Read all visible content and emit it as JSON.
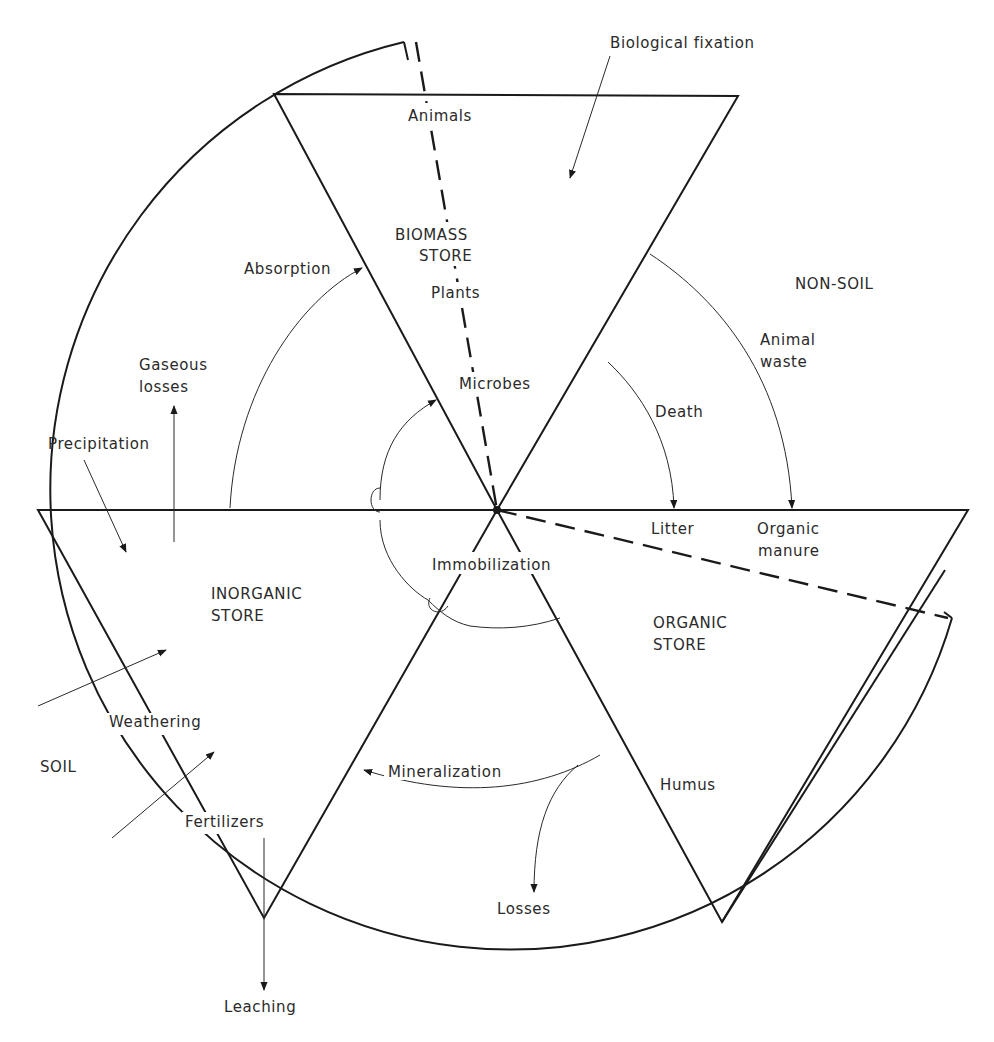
{
  "diagram": {
    "regions": {
      "non_soil": "NON-SOIL",
      "soil": "SOIL"
    },
    "stores": {
      "biomass": {
        "line1": "BIOMASS",
        "line2": "STORE",
        "components": [
          "Animals",
          "Plants",
          "Microbes"
        ]
      },
      "inorganic": {
        "line1": "INORGANIC",
        "line2": "STORE"
      },
      "organic": {
        "line1": "ORGANIC",
        "line2": "STORE",
        "components": [
          "Litter",
          "Organic",
          "manure",
          "Humus"
        ]
      }
    },
    "flows": {
      "biological_fixation": "Biological fixation",
      "absorption": "Absorption",
      "gaseous_losses_1": "Gaseous",
      "gaseous_losses_2": "losses",
      "precipitation": "Precipitation",
      "death": "Death",
      "animal_waste_1": "Animal",
      "animal_waste_2": "waste",
      "immobilization": "Immobilization",
      "mineralization": "Mineralization",
      "weathering": "Weathering",
      "fertilizers": "Fertilizers",
      "losses": "Losses",
      "leaching": "Leaching"
    },
    "colors": {
      "ink": "#1a1a1a",
      "background": "#ffffff"
    }
  }
}
